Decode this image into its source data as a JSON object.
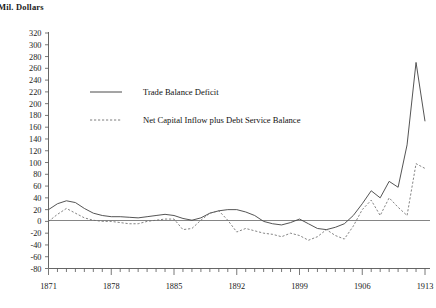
{
  "axis_title": "Mil. Dollars",
  "legend": {
    "items": [
      {
        "label": "Trade Balance Deficit",
        "style": "solid"
      },
      {
        "label": "Net Capital Inflow plus Debt Service Balance",
        "style": "dashed"
      }
    ]
  },
  "chart_data": {
    "type": "line",
    "title": "",
    "subtitle": "",
    "xlabel": "",
    "ylabel": "Mil. Dollars",
    "ylim": [
      -80,
      320
    ],
    "xlim": [
      1871,
      1913
    ],
    "ytick_step": 20,
    "grid": false,
    "legend_position": "upper-left-inside",
    "yticks": [
      -80,
      -60,
      -40,
      -20,
      0,
      20,
      40,
      60,
      80,
      100,
      120,
      140,
      160,
      180,
      200,
      220,
      240,
      260,
      280,
      300,
      320
    ],
    "xticks_labeled": [
      1871,
      1878,
      1885,
      1892,
      1899,
      1906,
      1913
    ],
    "xticks_all": [
      1871,
      1872,
      1873,
      1874,
      1875,
      1876,
      1877,
      1878,
      1879,
      1880,
      1881,
      1882,
      1883,
      1884,
      1885,
      1886,
      1887,
      1888,
      1889,
      1890,
      1891,
      1892,
      1893,
      1894,
      1895,
      1896,
      1897,
      1898,
      1899,
      1900,
      1901,
      1902,
      1903,
      1904,
      1905,
      1906,
      1907,
      1908,
      1909,
      1910,
      1911,
      1912,
      1913
    ],
    "x": [
      1871,
      1872,
      1873,
      1874,
      1875,
      1876,
      1877,
      1878,
      1879,
      1880,
      1881,
      1882,
      1883,
      1884,
      1885,
      1886,
      1887,
      1888,
      1889,
      1890,
      1891,
      1892,
      1893,
      1894,
      1895,
      1896,
      1897,
      1898,
      1899,
      1900,
      1901,
      1902,
      1903,
      1904,
      1905,
      1906,
      1907,
      1908,
      1909,
      1910,
      1911,
      1912,
      1913
    ],
    "series": [
      {
        "name": "Trade Balance Deficit",
        "style": "solid",
        "values": [
          20,
          30,
          35,
          32,
          22,
          14,
          10,
          8,
          8,
          7,
          6,
          8,
          10,
          12,
          10,
          5,
          2,
          6,
          14,
          18,
          20,
          20,
          16,
          10,
          0,
          -4,
          -6,
          -2,
          4,
          -4,
          -12,
          -14,
          -10,
          -4,
          10,
          30,
          52,
          40,
          68,
          58,
          130,
          270,
          170
        ]
      },
      {
        "name": "Net Capital Inflow plus Debt Service Balance",
        "style": "dashed",
        "values": [
          0,
          12,
          22,
          14,
          6,
          2,
          0,
          0,
          -2,
          -4,
          -4,
          0,
          2,
          4,
          4,
          -14,
          -12,
          2,
          14,
          18,
          2,
          -18,
          -12,
          -16,
          -20,
          -22,
          -26,
          -20,
          -24,
          -32,
          -26,
          -14,
          -24,
          -30,
          -8,
          20,
          36,
          10,
          40,
          24,
          10,
          98,
          90
        ]
      }
    ]
  }
}
